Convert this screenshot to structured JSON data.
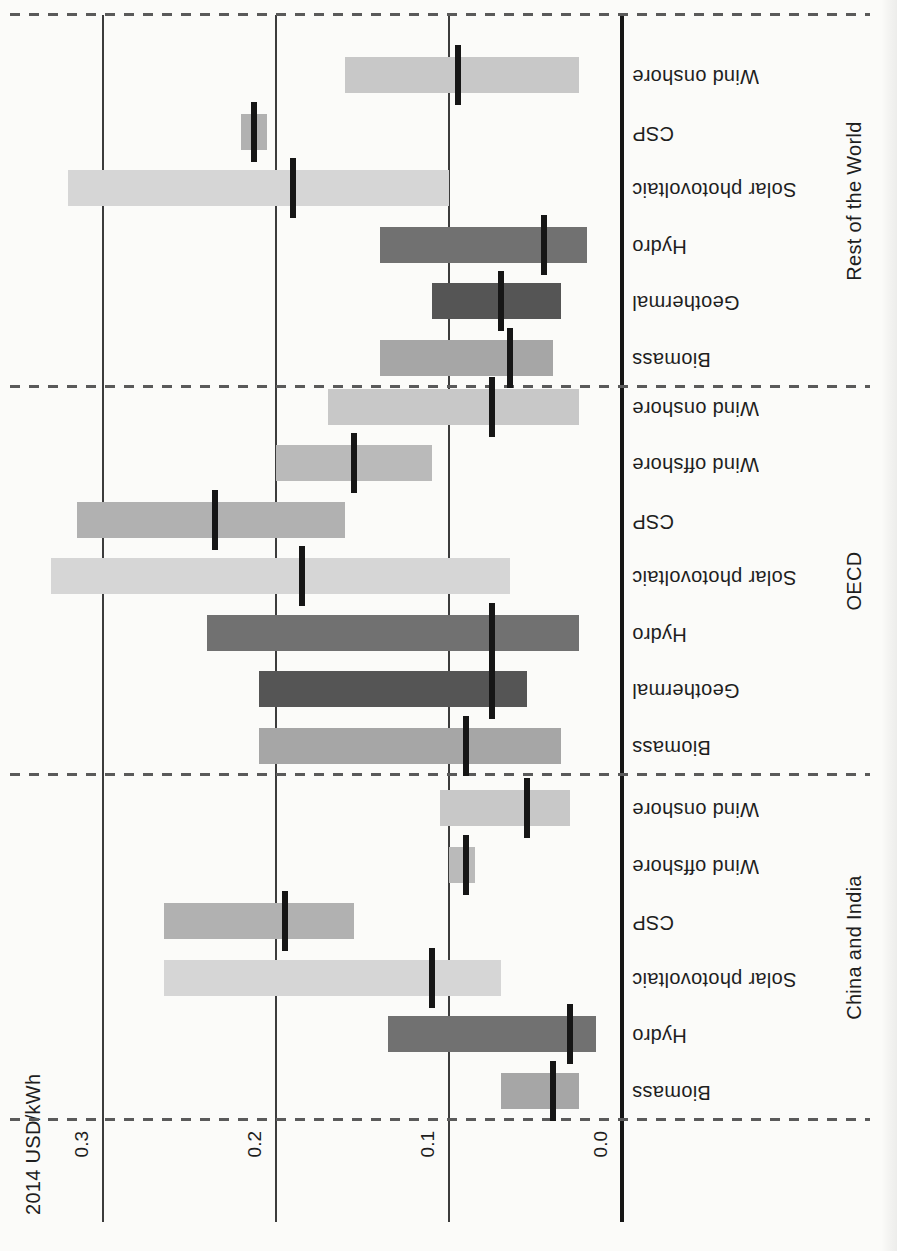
{
  "chart_data": {
    "type": "bar",
    "subtype": "floating-range-bars-with-average-markers",
    "title": "",
    "ylabel": "2014 USD/kWh",
    "ylim": [
      0.0,
      0.3
    ],
    "axis_ticks": [
      {
        "value": 0.0,
        "label": "0.0"
      },
      {
        "value": 0.1,
        "label": "0.1"
      },
      {
        "value": 0.2,
        "label": "0.2"
      },
      {
        "value": 0.3,
        "label": "0.3"
      }
    ],
    "layout_hints": {
      "page_orientation": "chart rotated 90 degrees counter-clockwise on portrait page",
      "grid": "solid horizontal gridlines at 0.1, 0.2, 0.3; thick baseline at 0.0",
      "region_separators": "dashed lines at outer edges and between regions",
      "marker_meaning": "black tick = weighted average within range bar"
    },
    "colors": {
      "background": "#fbfbf9",
      "text": "#1e1e1e",
      "gridline": "#3c3c3c",
      "axis_line": "#161616",
      "separator_dash": "#5a5a5a",
      "average_marker": "#161616",
      "biomass": "#a6a6a6",
      "geothermal": "#555555",
      "hydro": "#717171",
      "solar_photovoltaic": "#d6d6d6",
      "csp": "#b1b1b1",
      "wind_offshore": "#bababa",
      "wind_onshore": "#c8c8c8"
    },
    "groups": [
      {
        "label": "China and India",
        "bars": [
          {
            "technology": "Biomass",
            "color": "biomass",
            "min": 0.025,
            "max": 0.07,
            "average": 0.04
          },
          {
            "technology": "Hydro",
            "color": "hydro",
            "min": 0.015,
            "max": 0.135,
            "average": 0.03
          },
          {
            "technology": "Solar photovoltaic",
            "color": "solar_photovoltaic",
            "min": 0.07,
            "max": 0.265,
            "average": 0.11
          },
          {
            "technology": "CSP",
            "color": "csp",
            "min": 0.155,
            "max": 0.265,
            "average": 0.195
          },
          {
            "technology": "Wind offshore",
            "color": "wind_offshore",
            "min": 0.085,
            "max": 0.1,
            "average": 0.09
          },
          {
            "technology": "Wind onshore",
            "color": "wind_onshore",
            "min": 0.03,
            "max": 0.105,
            "average": 0.055
          }
        ]
      },
      {
        "label": "OECD",
        "bars": [
          {
            "technology": "Biomass",
            "color": "biomass",
            "min": 0.035,
            "max": 0.21,
            "average": 0.09
          },
          {
            "technology": "Geothermal",
            "color": "geothermal",
            "min": 0.055,
            "max": 0.21,
            "average": 0.075
          },
          {
            "technology": "Hydro",
            "color": "hydro",
            "min": 0.025,
            "max": 0.24,
            "average": 0.075
          },
          {
            "technology": "Solar photovoltaic",
            "color": "solar_photovoltaic",
            "min": 0.065,
            "max": 0.33,
            "average": 0.185
          },
          {
            "technology": "CSP",
            "color": "csp",
            "min": 0.16,
            "max": 0.315,
            "average": 0.235
          },
          {
            "technology": "Wind offshore",
            "color": "wind_offshore",
            "min": 0.11,
            "max": 0.2,
            "average": 0.155
          },
          {
            "technology": "Wind onshore",
            "color": "wind_onshore",
            "min": 0.025,
            "max": 0.17,
            "average": 0.075
          }
        ]
      },
      {
        "label": "Rest of the World",
        "bars": [
          {
            "technology": "Biomass",
            "color": "biomass",
            "min": 0.04,
            "max": 0.14,
            "average": 0.065
          },
          {
            "technology": "Geothermal",
            "color": "geothermal",
            "min": 0.035,
            "max": 0.11,
            "average": 0.07
          },
          {
            "technology": "Hydro",
            "color": "hydro",
            "min": 0.02,
            "max": 0.14,
            "average": 0.045
          },
          {
            "technology": "Solar photovoltaic",
            "color": "solar_photovoltaic",
            "min": 0.1,
            "max": 0.32,
            "average": 0.19
          },
          {
            "technology": "CSP",
            "color": "csp",
            "min": 0.205,
            "max": 0.22,
            "average": 0.213
          },
          {
            "technology": "Wind onshore",
            "color": "wind_onshore",
            "min": 0.025,
            "max": 0.16,
            "average": 0.095
          }
        ]
      }
    ]
  }
}
